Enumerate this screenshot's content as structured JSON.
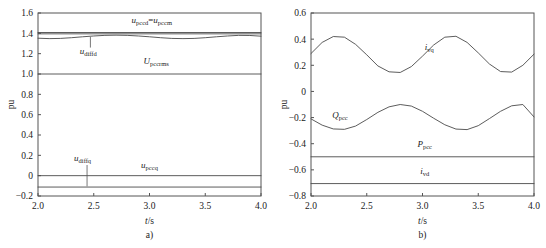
{
  "figure": {
    "panels": [
      {
        "id": "a",
        "caption": "a)",
        "xlabel": "t/s",
        "ylabel": "pu"
      },
      {
        "id": "b",
        "caption": "b)",
        "xlabel": "t/s",
        "ylabel": "pu"
      }
    ]
  },
  "chart_data": [
    {
      "type": "line",
      "panel": "a",
      "title": "",
      "xlabel": "t/s",
      "ylabel": "pu",
      "xlim": [
        2.0,
        4.0
      ],
      "ylim": [
        -0.2,
        1.6
      ],
      "xticks": [
        2.0,
        2.5,
        3.0,
        3.5,
        4.0
      ],
      "xticklabels": [
        "2.0",
        "2.5",
        "3.0",
        "3.5",
        "4.0"
      ],
      "yticks": [
        -0.2,
        0,
        0.2,
        0.4,
        0.6,
        0.8,
        1.0,
        1.2,
        1.4,
        1.6
      ],
      "yticklabels": [
        "-0.2",
        "0",
        "0.2",
        "0.4",
        "0.6",
        "0.8",
        "1.0",
        "1.2",
        "1.4",
        "1.6"
      ],
      "grid": false,
      "legend": "inline-annotations",
      "series": [
        {
          "name": "u_pccd = u_pccm",
          "label_html": "<tspan class='var'>u</tspan><tspan class='sub' dy='2'>pccd</tspan><tspan dy='-2'>=</tspan><tspan class='var'>u</tspan><tspan class='sub' dy='2'>pccm</tspan>",
          "label_x": 3.02,
          "label_y": 1.5,
          "kind": "constant",
          "value": 1.408,
          "values": [
            1.408,
            1.408,
            1.408,
            1.408,
            1.408,
            1.408,
            1.408,
            1.408,
            1.408
          ]
        },
        {
          "name": "u_pccm_second",
          "label_html": "",
          "kind": "constant",
          "value": 1.395,
          "values": [
            1.395,
            1.395,
            1.395,
            1.395,
            1.395,
            1.395,
            1.395,
            1.395,
            1.395
          ]
        },
        {
          "name": "u_diffd",
          "label_html": "<tspan class='var'>u</tspan><tspan class='sub' dy='2'>diffd</tspan>",
          "label_x": 2.45,
          "label_y": 1.195,
          "leader_from": [
            2.47,
            1.26
          ],
          "leader_to": [
            2.47,
            1.365
          ],
          "kind": "wave",
          "baseline": 1.363,
          "amplitude": 0.018,
          "period": 1.0,
          "phase": 0.0,
          "x": [
            2.0,
            2.1,
            2.2,
            2.3,
            2.4,
            2.5,
            2.6,
            2.7,
            2.8,
            2.9,
            3.0,
            3.1,
            3.2,
            3.3,
            3.4,
            3.5,
            3.6,
            3.7,
            3.8,
            3.9,
            4.0
          ],
          "values": [
            1.352,
            1.348,
            1.35,
            1.357,
            1.366,
            1.374,
            1.38,
            1.382,
            1.38,
            1.374,
            1.366,
            1.357,
            1.35,
            1.348,
            1.35,
            1.357,
            1.366,
            1.374,
            1.38,
            1.379,
            1.372
          ]
        },
        {
          "name": "U_pccrms",
          "label_html": "<tspan class='var'>U</tspan><tspan class='sub' dy='2'>pccrms</tspan>",
          "label_x": 3.06,
          "label_y": 1.1,
          "kind": "constant",
          "value": 1.0,
          "values": [
            1.0,
            1.0,
            1.0,
            1.0,
            1.0,
            1.0,
            1.0,
            1.0,
            1.0
          ]
        },
        {
          "name": "u_pccq",
          "label_html": "<tspan class='var'>u</tspan><tspan class='sub' dy='2'>pccq</tspan>",
          "label_x": 3.0,
          "label_y": 0.075,
          "kind": "constant",
          "value": 0.0,
          "values": [
            0.0,
            0.0,
            0.0,
            0.0,
            0.0,
            0.0,
            0.0,
            0.0,
            0.0
          ]
        },
        {
          "name": "u_diffq",
          "label_html": "<tspan class='var'>u</tspan><tspan class='sub' dy='2'>diffq</tspan>",
          "label_x": 2.4,
          "label_y": 0.145,
          "leader_from": [
            2.44,
            0.105
          ],
          "leader_to": [
            2.44,
            -0.105
          ],
          "kind": "constant",
          "value": -0.112,
          "values": [
            -0.112,
            -0.112,
            -0.112,
            -0.112,
            -0.112,
            -0.112,
            -0.112,
            -0.112,
            -0.112
          ]
        }
      ]
    },
    {
      "type": "line",
      "panel": "b",
      "title": "",
      "xlabel": "t/s",
      "ylabel": "pu",
      "xlim": [
        2.0,
        4.0
      ],
      "ylim": [
        -0.8,
        0.6
      ],
      "xticks": [
        2.0,
        2.5,
        3.0,
        3.5,
        4.0
      ],
      "xticklabels": [
        "2.0",
        "2.5",
        "3.0",
        "3.5",
        "4.0"
      ],
      "yticks": [
        -0.8,
        -0.6,
        -0.4,
        -0.2,
        0,
        0.2,
        0.4,
        0.6
      ],
      "yticklabels": [
        "-0.8",
        "-0.6",
        "-0.4",
        "-0.2",
        "0",
        "0.2",
        "0.4",
        "0.6"
      ],
      "grid": false,
      "legend": "inline-annotations",
      "series": [
        {
          "name": "i_vq",
          "label_html": "<tspan class='var'>i</tspan><tspan class='sub' dy='2'>vq</tspan>",
          "label_x": 3.06,
          "label_y": 0.315,
          "kind": "wave",
          "baseline": 0.285,
          "amplitude": 0.14,
          "period": 1.0,
          "phase": 0.0,
          "x": [
            2.0,
            2.1,
            2.2,
            2.3,
            2.4,
            2.5,
            2.6,
            2.7,
            2.8,
            2.9,
            3.0,
            3.1,
            3.2,
            3.3,
            3.4,
            3.5,
            3.6,
            3.7,
            3.8,
            3.9,
            4.0
          ],
          "values": [
            0.29,
            0.375,
            0.42,
            0.415,
            0.36,
            0.28,
            0.195,
            0.15,
            0.145,
            0.19,
            0.27,
            0.355,
            0.415,
            0.422,
            0.375,
            0.295,
            0.21,
            0.152,
            0.148,
            0.2,
            0.285
          ]
        },
        {
          "name": "Q_pcc",
          "label_html": "<tspan class='var'>Q</tspan><tspan class='sub' dy='2'>pcc</tspan>",
          "label_x": 2.26,
          "label_y": -0.205,
          "kind": "wave",
          "baseline": -0.195,
          "amplitude": 0.1,
          "period": 1.0,
          "phase": 0.5,
          "x": [
            2.0,
            2.1,
            2.2,
            2.3,
            2.4,
            2.5,
            2.6,
            2.7,
            2.8,
            2.9,
            3.0,
            3.1,
            3.2,
            3.3,
            3.4,
            3.5,
            3.6,
            3.7,
            3.8,
            3.9,
            4.0
          ],
          "values": [
            -0.21,
            -0.258,
            -0.287,
            -0.29,
            -0.265,
            -0.215,
            -0.16,
            -0.118,
            -0.1,
            -0.112,
            -0.152,
            -0.205,
            -0.255,
            -0.288,
            -0.292,
            -0.262,
            -0.208,
            -0.152,
            -0.11,
            -0.1,
            -0.195
          ]
        },
        {
          "name": "P_pcc",
          "label_html": "<tspan class='var'>P</tspan><tspan class='sub' dy='2'>pcc</tspan>",
          "label_x": 3.02,
          "label_y": -0.425,
          "kind": "constant",
          "value": -0.5,
          "values": [
            -0.5,
            -0.5,
            -0.5,
            -0.5,
            -0.5,
            -0.5,
            -0.5,
            -0.5,
            -0.5
          ]
        },
        {
          "name": "i_vd",
          "label_html": "<tspan class='var'>i</tspan><tspan class='sub' dy='2'>vd</tspan>",
          "label_x": 3.02,
          "label_y": -0.635,
          "kind": "constant",
          "value": -0.705,
          "values": [
            -0.705,
            -0.705,
            -0.705,
            -0.705,
            -0.705,
            -0.705,
            -0.705,
            -0.705,
            -0.705
          ]
        }
      ]
    }
  ]
}
